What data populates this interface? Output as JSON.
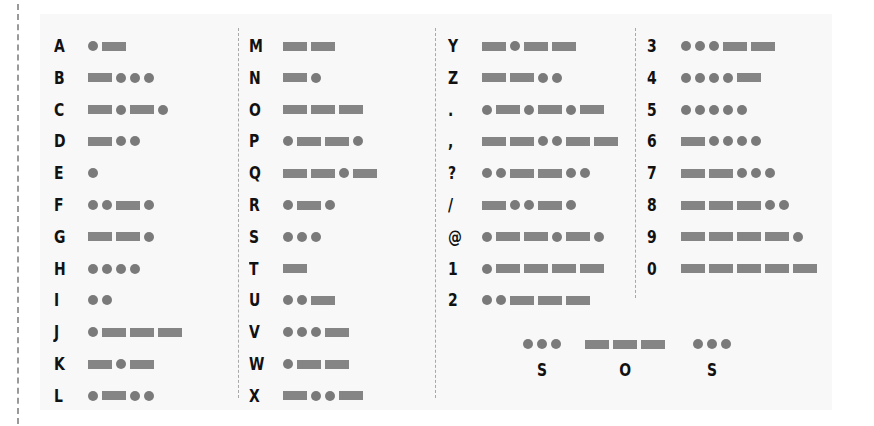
{
  "legend": {
    "dot": "short signal (dot)",
    "dash": "long signal (dash)"
  },
  "colors": {
    "background": "#f8f8f8",
    "symbol": "#808080",
    "text": "#111111"
  },
  "columns": [
    {
      "entries": [
        {
          "char": "A",
          "code": ".-"
        },
        {
          "char": "B",
          "code": "-..."
        },
        {
          "char": "C",
          "code": "-.-."
        },
        {
          "char": "D",
          "code": "-.."
        },
        {
          "char": "E",
          "code": "."
        },
        {
          "char": "F",
          "code": "..-."
        },
        {
          "char": "G",
          "code": "--."
        },
        {
          "char": "H",
          "code": "...."
        },
        {
          "char": "I",
          "code": ".."
        },
        {
          "char": "J",
          "code": ".---"
        },
        {
          "char": "K",
          "code": "-.-"
        },
        {
          "char": "L",
          "code": ".-.."
        }
      ]
    },
    {
      "entries": [
        {
          "char": "M",
          "code": "--"
        },
        {
          "char": "N",
          "code": "-."
        },
        {
          "char": "O",
          "code": "---"
        },
        {
          "char": "P",
          "code": ".--."
        },
        {
          "char": "Q",
          "code": "--.-"
        },
        {
          "char": "R",
          "code": ".-."
        },
        {
          "char": "S",
          "code": "..."
        },
        {
          "char": "T",
          "code": "-"
        },
        {
          "char": "U",
          "code": "..-"
        },
        {
          "char": "V",
          "code": "...-"
        },
        {
          "char": "W",
          "code": ".--"
        },
        {
          "char": "X",
          "code": "-..-"
        }
      ]
    },
    {
      "entries": [
        {
          "char": "Y",
          "code": "-.--"
        },
        {
          "char": "Z",
          "code": "--.."
        },
        {
          "char": ".",
          "code": ".-.-.-"
        },
        {
          "char": ",",
          "code": "--..--"
        },
        {
          "char": "?",
          "code": "..--.."
        },
        {
          "char": "/",
          "code": "-..-."
        },
        {
          "char": "@",
          "code": ".--.-."
        },
        {
          "char": "1",
          "code": ".----"
        },
        {
          "char": "2",
          "code": "..---"
        }
      ]
    },
    {
      "entries": [
        {
          "char": "3",
          "code": "...--"
        },
        {
          "char": "4",
          "code": "....-"
        },
        {
          "char": "5",
          "code": "....."
        },
        {
          "char": "6",
          "code": "-...."
        },
        {
          "char": "7",
          "code": "--..."
        },
        {
          "char": "8",
          "code": "---.."
        },
        {
          "char": "9",
          "code": "----."
        },
        {
          "char": "0",
          "code": "-----"
        }
      ]
    }
  ],
  "example": {
    "label": "SOS",
    "groups": [
      {
        "letter": "S",
        "code": "..."
      },
      {
        "letter": "O",
        "code": "---"
      },
      {
        "letter": "S",
        "code": "..."
      }
    ]
  }
}
